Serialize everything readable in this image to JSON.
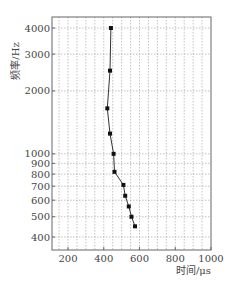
{
  "chart_data": {
    "type": "line",
    "title": "",
    "xlabel": "时间/μs",
    "ylabel": "频率/Hz",
    "xlim": [
      110,
      1000
    ],
    "ylim": [
      340,
      4800
    ],
    "yscale": "log",
    "grid": true,
    "legend": null,
    "x_ticks": [
      200,
      400,
      600,
      800,
      1000
    ],
    "x_tick_labels": [
      "200",
      "400",
      "600",
      "800",
      "1000"
    ],
    "y_ticks": [
      400,
      500,
      600,
      700,
      800,
      900,
      1000,
      2000,
      3000,
      4000
    ],
    "y_tick_labels": [
      "400",
      "500",
      "600",
      "700",
      "800",
      "900",
      "1000",
      "2000",
      "3000",
      "4000"
    ],
    "series": [
      {
        "name": "frequency-vs-time",
        "marker": "square",
        "color": "#222222",
        "points": [
          {
            "x": 440,
            "y": 4000
          },
          {
            "x": 435,
            "y": 2500
          },
          {
            "x": 420,
            "y": 1650
          },
          {
            "x": 435,
            "y": 1250
          },
          {
            "x": 455,
            "y": 1000
          },
          {
            "x": 460,
            "y": 820
          },
          {
            "x": 510,
            "y": 710
          },
          {
            "x": 520,
            "y": 630
          },
          {
            "x": 540,
            "y": 560
          },
          {
            "x": 555,
            "y": 500
          },
          {
            "x": 575,
            "y": 450
          }
        ]
      }
    ]
  },
  "colors": {
    "axis": "#666666",
    "grid": "#9a9a9a",
    "line": "#333333",
    "marker": "#111111"
  }
}
